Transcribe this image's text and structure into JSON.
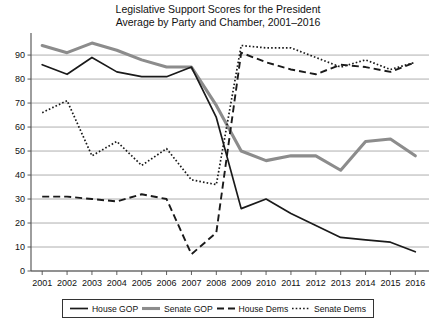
{
  "chart_data": {
    "type": "line",
    "title": "Legislative Support Scores for the President",
    "subtitle": "Average by Party and Chamber, 2001–2016",
    "xlabel": "",
    "ylabel": "",
    "ylim": [
      0,
      100
    ],
    "ytick_step": 10,
    "grid": true,
    "legend_position": "bottom",
    "categories": [
      "2001",
      "2002",
      "2003",
      "2004",
      "2005",
      "2006",
      "2007",
      "2008",
      "2009",
      "2010",
      "2011",
      "2012",
      "2013",
      "2014",
      "2015",
      "2016"
    ],
    "yticks": [
      "0",
      "10",
      "20",
      "30",
      "40",
      "50",
      "60",
      "70",
      "80",
      "90"
    ],
    "series": [
      {
        "name": "House GOP",
        "style": "solid-thin-black",
        "color": "#1a1a1a",
        "values": [
          86,
          82,
          89,
          83,
          81,
          81,
          85,
          64,
          26,
          30,
          24,
          19,
          14,
          13,
          12,
          8
        ]
      },
      {
        "name": "Senate GOP",
        "style": "solid-thick-gray",
        "color": "#8c8c8c",
        "values": [
          94,
          91,
          95,
          92,
          88,
          85,
          85,
          69,
          50,
          46,
          48,
          48,
          42,
          54,
          55,
          48
        ]
      },
      {
        "name": "House Dems",
        "style": "dashed-black",
        "color": "#1a1a1a",
        "values": [
          31,
          31,
          30,
          29,
          32,
          30,
          7,
          16,
          91,
          87,
          84,
          82,
          86,
          85,
          83,
          87
        ]
      },
      {
        "name": "Senate Dems",
        "style": "dotted-black",
        "color": "#1a1a1a",
        "values": [
          66,
          71,
          48,
          54,
          44,
          51,
          38,
          36,
          94,
          93,
          93,
          89,
          85,
          88,
          84,
          87
        ]
      }
    ]
  },
  "legend": {
    "items": [
      {
        "label": "House GOP",
        "style": "solid-thin-black"
      },
      {
        "label": "Senate GOP",
        "style": "solid-thick-gray"
      },
      {
        "label": "House Dems",
        "style": "dashed-black"
      },
      {
        "label": "Senate Dems",
        "style": "dotted-black"
      }
    ]
  }
}
